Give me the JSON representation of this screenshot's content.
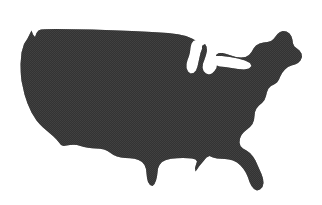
{
  "figure": {
    "kind": "map-silhouette",
    "subject": "Contiguous United States",
    "title": "",
    "caption": "",
    "labels": [],
    "background_color": "#ffffff",
    "land_fill_color": "#383838",
    "land_fill_dark": "#2b2b2b",
    "water_color": "#ffffff",
    "texture": "halftone-dither",
    "canvas": {
      "width": 322,
      "height": 205
    },
    "land_bbox": {
      "x": 20,
      "y": 29,
      "width": 286,
      "height": 163
    },
    "features": {
      "great_lakes": "white-notch",
      "florida_peninsula": "present",
      "texas_gulf": "present",
      "maine_northeast": "present",
      "puget_sound_notch": "present"
    },
    "geometry": {
      "land_outline": "M 20.5 64.0 L 21.5 52.5 L 24.0 44.0 L 27.5 38.5 L 30.0 33.5 L 31.5 30.5 L 33.0 34.5 L 35.0 37.0 L 36.5 33.0 L 38.5 30.5 L 41.0 29.5 L 45.0 29.2 L 56.0 29.0 L 72.0 29.2 L 92.0 29.6 L 112.0 30.2 L 132.0 31.0 L 152.0 32.0 L 168.0 33.0 L 178.0 34.2 L 186.0 36.0 L 192.0 38.6 L 196.5 41.0 L 198.0 44.0 L 196.0 47.0 L 193.0 49.0 L 192.0 52.0 L 193.5 55.0 L 196.0 57.0 L 198.5 56.0 L 199.5 52.5 L 200.5 48.5 L 202.5 45.5 L 205.0 44.0 L 206.5 46.5 L 207.0 50.5 L 206.0 55.0 L 204.5 59.5 L 203.0 63.5 L 202.5 67.5 L 203.5 71.0 L 206.0 73.5 L 209.0 74.5 L 212.0 73.5 L 214.5 71.0 L 216.5 68.0 L 217.0 64.5 L 216.0 61.0 L 215.5 57.5 L 216.5 54.5 L 219.0 53.0 L 222.5 53.0 L 226.5 54.0 L 231.0 55.5 L 236.0 57.0 L 241.0 57.6 L 245.5 57.0 L 249.0 55.0 L 251.5 52.0 L 253.5 48.5 L 256.0 45.5 L 259.5 43.5 L 263.5 42.5 L 267.5 42.0 L 271.0 41.0 L 273.5 39.0 L 275.5 36.5 L 277.5 34.0 L 280.0 32.0 L 283.0 31.0 L 286.5 31.5 L 289.5 33.5 L 291.5 36.5 L 292.5 40.0 L 293.0 43.5 L 294.5 46.5 L 297.0 48.5 L 299.5 50.5 L 301.5 53.5 L 302.0 57.0 L 300.5 60.5 L 298.0 63.0 L 295.0 64.5 L 291.5 65.5 L 288.0 67.0 L 285.0 69.5 L 282.5 72.5 L 280.5 76.0 L 279.0 79.5 L 277.0 82.5 L 274.0 84.5 L 271.0 86.0 L 268.5 88.5 L 267.0 92.0 L 266.0 96.0 L 264.5 100.0 L 262.0 103.0 L 259.0 105.5 L 256.5 108.5 L 255.0 112.0 L 254.5 116.0 L 254.0 120.0 L 252.5 124.0 L 250.0 127.0 L 247.0 129.5 L 244.0 132.0 L 241.5 135.0 L 240.0 138.5 L 239.5 142.5 L 240.5 146.0 L 243.0 148.5 L 246.5 150.5 L 250.0 153.0 L 253.0 156.5 L 255.5 160.5 L 257.5 165.0 L 259.5 169.5 L 261.5 174.0 L 263.0 178.5 L 263.5 183.0 L 262.5 187.0 L 260.0 189.5 L 257.0 190.5 L 254.0 189.0 L 251.5 186.0 L 249.5 182.0 L 248.0 177.5 L 246.0 173.0 L 243.5 169.0 L 240.5 165.5 L 237.0 162.5 L 233.0 160.5 L 229.0 159.5 L 225.0 159.0 L 221.0 158.8 L 217.0 158.5 L 213.0 157.5 L 209.5 156.0 L 206.5 157.5 L 204.0 160.5 L 201.5 163.5 L 199.0 166.5 L 197.0 169.5 L 195.5 171.5 L 195.0 168.0 L 196.0 164.5 L 197.0 161.5 L 195.5 159.5 L 192.0 158.5 L 188.0 158.2 L 183.0 158.0 L 177.0 158.2 L 171.0 158.8 L 166.0 160.0 L 162.0 162.0 L 159.5 165.0 L 158.0 168.5 L 157.5 172.5 L 157.0 176.5 L 156.0 180.5 L 154.5 184.0 L 152.5 186.0 L 150.0 185.0 L 148.0 182.0 L 147.0 178.0 L 146.5 173.5 L 146.0 169.0 L 144.5 165.0 L 142.0 162.0 L 138.5 160.0 L 134.5 158.8 L 130.0 158.2 L 125.5 158.0 L 121.0 157.5 L 117.0 156.5 L 113.5 155.0 L 110.5 153.0 L 107.5 151.0 L 104.0 149.5 L 100.0 148.8 L 96.0 148.5 L 92.0 148.2 L 88.0 147.8 L 84.0 147.0 L 80.5 146.0 L 77.0 145.0 L 73.5 144.8 L 70.0 145.0 L 66.5 145.5 L 63.5 146.0 L 61.0 145.0 L 59.0 142.5 L 56.5 139.5 L 53.5 136.5 L 50.0 133.5 L 46.5 130.5 L 43.0 127.5 L 39.5 124.0 L 36.5 120.5 L 34.0 116.5 L 31.5 112.5 L 29.5 108.0 L 27.5 103.5 L 26.0 99.0 L 24.5 94.5 L 23.5 90.0 L 22.5 85.5 L 21.5 81.0 L 21.0 76.5 L 20.7 72.0 Z",
      "lake_michigan": "M 196.0 40.0 L 199.5 42.0 L 202.0 45.0 L 202.0 49.0 L 200.5 53.0 L 199.5 57.5 L 198.5 62.0 L 197.5 66.5 L 196.0 70.5 L 193.5 73.0 L 190.5 73.5 L 188.0 71.5 L 186.5 68.0 L 186.5 64.0 L 187.5 60.0 L 189.0 56.0 L 190.0 52.0 L 190.5 47.5 L 191.5 43.5 L 193.5 40.8 Z",
      "lake_superior_huron": "M 200.0 33.0 L 208.0 34.0 L 216.0 35.5 L 224.0 37.5 L 231.0 40.0 L 236.0 43.0 L 238.0 46.5 L 236.5 50.0 L 232.5 51.5 L 227.5 51.5 L 222.0 50.5 L 216.5 49.5 L 211.5 49.0 L 208.5 47.5 L 207.5 44.0 L 207.0 40.0 L 205.0 36.5 L 202.0 34.5 Z",
      "lake_erie_ontario": "M 214.0 56.0 L 222.0 56.0 L 230.0 57.0 L 238.0 58.5 L 245.0 60.5 L 250.0 63.0 L 251.5 66.0 L 249.0 68.5 L 244.0 69.5 L 238.0 69.0 L 231.5 68.0 L 225.0 67.0 L 219.5 66.5 L 215.5 65.0 L 213.5 62.0 L 213.0 58.5 Z",
      "chesapeake_notch": "M 270.0 96.0 L 272.5 98.0 L 273.5 101.5 L 273.0 105.0 L 271.5 108.0 L 269.5 107.0 L 268.5 103.5 L 268.5 99.5 Z"
    }
  }
}
